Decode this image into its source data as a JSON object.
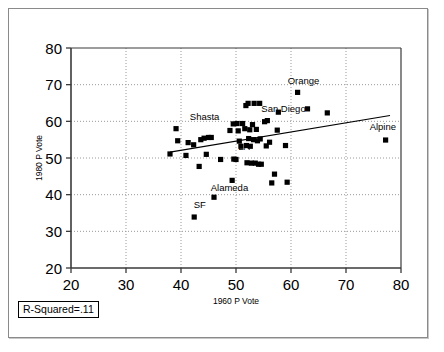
{
  "chart_data": {
    "type": "scatter",
    "title": "",
    "xlabel": "1960 P Vote",
    "ylabel": "1980 P Vote",
    "xlim": [
      20,
      80
    ],
    "ylim": [
      20,
      80
    ],
    "xticks": [
      20,
      30,
      40,
      50,
      60,
      70,
      80
    ],
    "yticks": [
      20,
      30,
      40,
      50,
      60,
      70,
      80
    ],
    "grid": true,
    "legend": "none",
    "marker": "filled-square",
    "marker_color": "#000000",
    "annotation": "R-Squared=.11",
    "trendline": {
      "type": "linear",
      "x": [
        38.0,
        78.0
      ],
      "y": [
        51.6,
        61.6
      ],
      "color": "#000000"
    },
    "points": [
      {
        "x": 38.0,
        "y": 51.1
      },
      {
        "x": 39.1,
        "y": 58.0
      },
      {
        "x": 39.4,
        "y": 54.7
      },
      {
        "x": 40.9,
        "y": 50.7
      },
      {
        "x": 41.3,
        "y": 54.2
      },
      {
        "x": 42.3,
        "y": 53.6
      },
      {
        "x": 42.4,
        "y": 33.9
      },
      {
        "x": 43.3,
        "y": 47.7
      },
      {
        "x": 43.6,
        "y": 55.0
      },
      {
        "x": 44.2,
        "y": 55.4
      },
      {
        "x": 44.6,
        "y": 51.0
      },
      {
        "x": 45.0,
        "y": 55.6
      },
      {
        "x": 45.5,
        "y": 55.6
      },
      {
        "x": 46.0,
        "y": 39.3
      },
      {
        "x": 47.2,
        "y": 49.6
      },
      {
        "x": 48.9,
        "y": 57.5
      },
      {
        "x": 49.3,
        "y": 43.9
      },
      {
        "x": 49.5,
        "y": 59.3
      },
      {
        "x": 49.6,
        "y": 49.7
      },
      {
        "x": 50.0,
        "y": 49.6
      },
      {
        "x": 50.2,
        "y": 59.4
      },
      {
        "x": 50.4,
        "y": 57.4
      },
      {
        "x": 50.6,
        "y": 54.6
      },
      {
        "x": 50.9,
        "y": 53.2
      },
      {
        "x": 51.2,
        "y": 59.4
      },
      {
        "x": 51.6,
        "y": 58.0
      },
      {
        "x": 51.8,
        "y": 64.3
      },
      {
        "x": 51.9,
        "y": 53.4
      },
      {
        "x": 52.0,
        "y": 48.7
      },
      {
        "x": 52.2,
        "y": 64.9
      },
      {
        "x": 52.3,
        "y": 55.3
      },
      {
        "x": 52.5,
        "y": 57.7
      },
      {
        "x": 52.6,
        "y": 53.2
      },
      {
        "x": 52.8,
        "y": 48.6
      },
      {
        "x": 53.0,
        "y": 59.1
      },
      {
        "x": 53.2,
        "y": 55.0
      },
      {
        "x": 53.3,
        "y": 64.9
      },
      {
        "x": 53.5,
        "y": 48.6
      },
      {
        "x": 53.7,
        "y": 57.8
      },
      {
        "x": 53.9,
        "y": 54.7
      },
      {
        "x": 54.1,
        "y": 48.3
      },
      {
        "x": 54.3,
        "y": 64.9
      },
      {
        "x": 54.4,
        "y": 55.2
      },
      {
        "x": 54.6,
        "y": 48.3
      },
      {
        "x": 55.2,
        "y": 59.9
      },
      {
        "x": 55.5,
        "y": 53.3
      },
      {
        "x": 55.7,
        "y": 60.2
      },
      {
        "x": 56.1,
        "y": 54.3
      },
      {
        "x": 56.5,
        "y": 43.2
      },
      {
        "x": 57.0,
        "y": 45.6
      },
      {
        "x": 57.5,
        "y": 57.6
      },
      {
        "x": 57.7,
        "y": 62.5
      },
      {
        "x": 59.0,
        "y": 53.4
      },
      {
        "x": 59.3,
        "y": 43.4
      },
      {
        "x": 61.2,
        "y": 67.9
      },
      {
        "x": 63.0,
        "y": 63.4
      },
      {
        "x": 66.6,
        "y": 62.3
      },
      {
        "x": 77.2,
        "y": 54.9
      }
    ],
    "labels": [
      {
        "text": "Shasta",
        "x": 41.6,
        "y": 60.4
      },
      {
        "text": "Orange",
        "x": 59.4,
        "y": 70.1
      },
      {
        "text": "San Diego",
        "x": 54.6,
        "y": 62.6
      },
      {
        "text": "Alpine",
        "x": 74.3,
        "y": 57.6
      },
      {
        "text": "LA",
        "x": 50.4,
        "y": 52.2
      },
      {
        "text": "Alameda",
        "x": 45.4,
        "y": 41.0
      },
      {
        "text": "SF",
        "x": 42.3,
        "y": 36.4
      }
    ]
  },
  "axes": {
    "x_title": "1960 P Vote",
    "y_title": "1980 P Vote",
    "x_tick_labels": [
      "20",
      "30",
      "40",
      "50",
      "60",
      "70",
      "80"
    ],
    "y_tick_labels": [
      "80",
      "70",
      "60",
      "50",
      "40",
      "30",
      "20"
    ]
  },
  "annotation_box": {
    "text": "R-Squared=.11"
  },
  "colors": {
    "marker": "#000000",
    "axis": "#3a3a3a",
    "grid": "#999999",
    "frame": "#8a8a8a",
    "background": "#ffffff"
  }
}
